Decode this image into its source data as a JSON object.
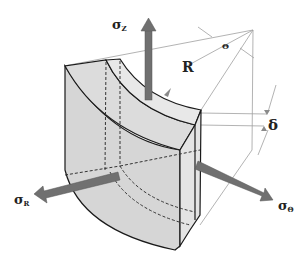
{
  "figure": {
    "labels": {
      "sigma_z": {
        "symbol": "σ",
        "sub": "Z"
      },
      "sigma_r": {
        "symbol": "σ",
        "sub": "R"
      },
      "sigma_theta": {
        "symbol": "σ",
        "sub": "Θ"
      },
      "radius": "R",
      "angle": "Θ",
      "delta": "δ"
    },
    "colors": {
      "body_fill": "#d9d9d9",
      "body_light": "#e6e6e6",
      "arrow_fill": "#707070",
      "outline": "#1a1a1a",
      "construction": "#9a9a9a"
    }
  }
}
